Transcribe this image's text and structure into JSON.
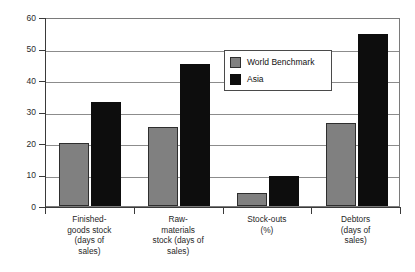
{
  "chart_data": {
    "type": "bar",
    "title": "",
    "subtitle": "",
    "xlabel": "",
    "ylabel": "",
    "ylim": [
      0,
      60
    ],
    "yticks": [
      0,
      10,
      20,
      30,
      40,
      50,
      60
    ],
    "ytick_labels": [
      "0",
      "10",
      "20",
      "30",
      "40",
      "50",
      "60"
    ],
    "grid": true,
    "legend_position": "inside-top-right",
    "categories": [
      "Finished-\ngoods stock\n(days of\nsales)",
      "Raw-\nmaterials\nstock (days of\nsales)",
      "Stock-outs\n(%)",
      "Debtors\n(days of\nsales)"
    ],
    "series": [
      {
        "name": "World Benchmark",
        "color": "#808080",
        "values": [
          20,
          25,
          4,
          26.5
        ]
      },
      {
        "name": "Asia",
        "color": "#0d0d0d",
        "values": [
          33,
          45,
          9.5,
          54.5
        ]
      }
    ]
  },
  "legend": {
    "items": [
      {
        "label": "World Benchmark",
        "swatch": "benchmark"
      },
      {
        "label": "Asia",
        "swatch": "asia"
      }
    ]
  },
  "colors": {
    "benchmark": "#808080",
    "asia": "#0d0d0d",
    "grid": "#8c8c8c",
    "axis": "#3a3a3a",
    "background": "#ffffff"
  }
}
